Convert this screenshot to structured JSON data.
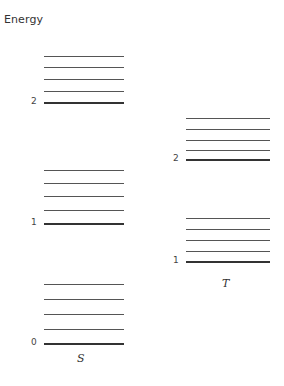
{
  "diagram": {
    "title": "Energy",
    "columns": [
      {
        "label": "S",
        "x_start": 44,
        "x_end": 124,
        "label_x": 77,
        "label_y": 352,
        "num_x": 31,
        "levels": [
          {
            "number": "2",
            "base_y": 103,
            "sub_ys": [
              56,
              67,
              79,
              91
            ]
          },
          {
            "number": "1",
            "base_y": 224,
            "sub_ys": [
              170,
              183,
              196,
              210
            ]
          },
          {
            "number": "0",
            "base_y": 344,
            "sub_ys": [
              284,
              299,
              314,
              329
            ]
          }
        ]
      },
      {
        "label": "T",
        "x_start": 186,
        "x_end": 270,
        "label_x": 222,
        "label_y": 277,
        "num_x": 173,
        "levels": [
          {
            "number": "2",
            "base_y": 160,
            "sub_ys": [
              118,
              129,
              140,
              150
            ]
          },
          {
            "number": "1",
            "base_y": 262,
            "sub_ys": [
              218,
              229,
              240,
              251
            ]
          }
        ]
      }
    ]
  }
}
